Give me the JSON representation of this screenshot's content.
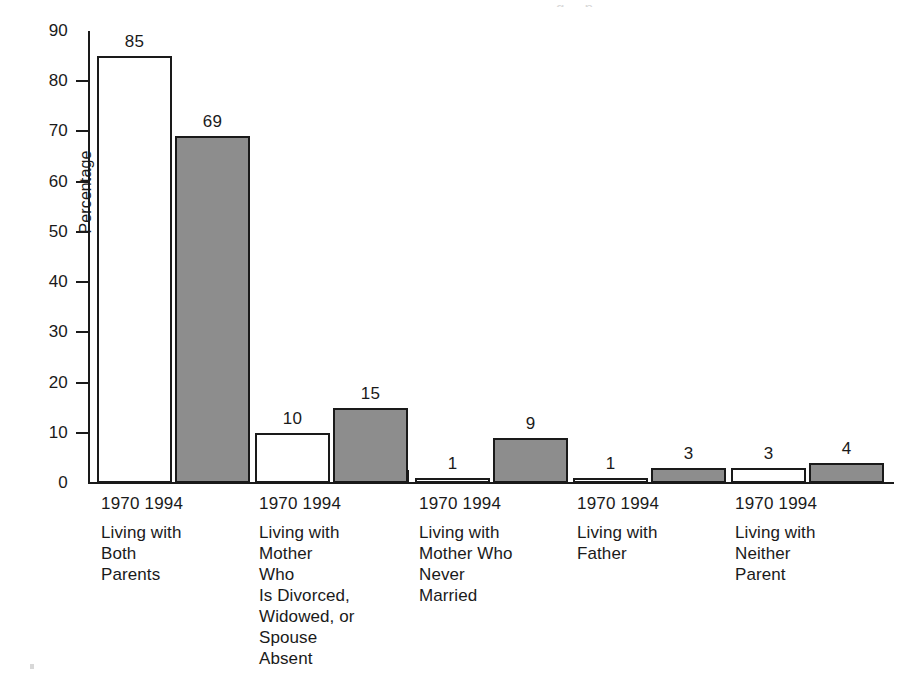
{
  "chart_data": {
    "type": "bar",
    "title": "",
    "subtitle": "",
    "xlabel": "",
    "ylabel": "Percentage",
    "ylim": [
      0,
      90
    ],
    "yticks": [
      0,
      10,
      20,
      30,
      40,
      50,
      60,
      70,
      80,
      90
    ],
    "ytick_labels": [
      "0",
      "10",
      "20",
      "30",
      "40",
      "50",
      "60",
      "70",
      "80",
      "90"
    ],
    "grid": false,
    "legend_position": "none",
    "categories": [
      "Living with Both Parents",
      "Living with Mother Who Is Divorced, Widowed, or Spouse Absent",
      "Living with Mother Who Never Married",
      "Living with Father",
      "Living with Neither Parent"
    ],
    "series": [
      {
        "name": "1970",
        "values": [
          85,
          10,
          1,
          1,
          3
        ],
        "fill": "#ffffff",
        "edge": "#1a1a1a"
      },
      {
        "name": "1994",
        "values": [
          69,
          15,
          9,
          3,
          4
        ],
        "fill": "#8d8d8d",
        "edge": "#1a1a1a"
      }
    ],
    "data_labels": [
      [
        "85",
        "69"
      ],
      [
        "10",
        "15"
      ],
      [
        "1",
        "9"
      ],
      [
        "1",
        "3"
      ],
      [
        "3",
        "4"
      ]
    ]
  },
  "axis": {
    "y_title": "Percentage",
    "y_ticks": [
      {
        "label": "90"
      },
      {
        "label": "80"
      },
      {
        "label": "70"
      },
      {
        "label": "60"
      },
      {
        "label": "50"
      },
      {
        "label": "40"
      },
      {
        "label": "30"
      },
      {
        "label": "20"
      },
      {
        "label": "10"
      },
      {
        "label": "0"
      }
    ]
  },
  "groups": [
    {
      "years": "1970 1994",
      "year_left": "1970",
      "year_right": "1994",
      "caption_lines": [
        "Living with",
        "Both",
        "Parents"
      ],
      "values": {
        "y1970": "85",
        "y1994": "69"
      }
    },
    {
      "years": "1970 1994",
      "year_left": "1970",
      "year_right": "1994",
      "caption_lines": [
        "Living with",
        "Mother",
        "Who",
        "Is Divorced,",
        "Widowed, or",
        "Spouse",
        "Absent"
      ],
      "values": {
        "y1970": "10",
        "y1994": "15"
      }
    },
    {
      "years": "1970 1994",
      "year_left": "1970",
      "year_right": "1994",
      "caption_lines": [
        "Living with",
        "Mother Who",
        "Never",
        "Married"
      ],
      "values": {
        "y1970": "1",
        "y1994": "9"
      }
    },
    {
      "years": "1970 1994",
      "year_left": "1970",
      "year_right": "1994",
      "caption_lines": [
        "Living with",
        "Father"
      ],
      "values": {
        "y1970": "1",
        "y1994": "3"
      }
    },
    {
      "years": "1970 1994",
      "year_left": "1970",
      "year_right": "1994",
      "caption_lines": [
        "Living with",
        "Neither",
        "Parent"
      ],
      "values": {
        "y1970": "3",
        "y1994": "4"
      }
    }
  ],
  "artifacts": {
    "top_cropped_text": "g  ,  p"
  },
  "colors": {
    "ink": "#1a1a1a",
    "bar_1994_fill": "#8d8d8d",
    "bar_1970_fill": "#ffffff",
    "background": "#ffffff"
  }
}
